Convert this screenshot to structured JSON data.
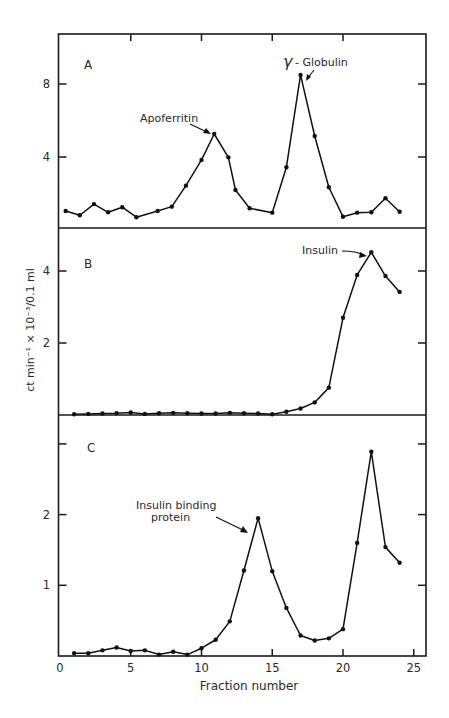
{
  "figure": {
    "xlabel": "Fraction number",
    "ylabel": "ct min⁻¹ × 10⁻³/0.1 ml",
    "x_ticks": [
      0,
      5,
      10,
      15,
      20,
      25
    ]
  },
  "chart_data": [
    {
      "type": "line",
      "panel": "A",
      "title": "A",
      "xlabel": "Fraction number",
      "ylabel": "ct min⁻¹ × 10⁻³/0.1 ml",
      "ylim": [
        0,
        10.6
      ],
      "y_ticks": [
        4,
        8
      ],
      "xlim": [
        0,
        26
      ],
      "grid": false,
      "x": [
        0.4,
        1.4,
        2.4,
        3.4,
        4.4,
        5.4,
        6.9,
        7.9,
        8.9,
        10,
        10.9,
        11.9,
        12.4,
        13.4,
        15,
        16,
        17,
        18,
        19,
        20,
        21,
        22,
        23,
        24
      ],
      "values": [
        1.04,
        0.81,
        1.42,
        0.97,
        1.25,
        0.7,
        1.04,
        1.28,
        2.43,
        3.84,
        5.26,
        3.98,
        2.19,
        1.19,
        0.95,
        3.44,
        8.5,
        5.15,
        2.34,
        0.73,
        0.95,
        0.97,
        1.74,
        1.0
      ],
      "annotations": [
        {
          "text": "Apoferritin",
          "x": 10.9,
          "y": 5.26
        },
        {
          "text": "γ - Globulin",
          "x": 17,
          "y": 8.5
        }
      ]
    },
    {
      "type": "line",
      "panel": "B",
      "title": "B",
      "xlabel": "Fraction number",
      "ylabel": "ct min⁻¹ × 10⁻³/0.1 ml",
      "ylim": [
        0,
        5.2
      ],
      "y_ticks": [
        2,
        4
      ],
      "xlim": [
        0,
        26
      ],
      "grid": false,
      "x": [
        1,
        2,
        3,
        4,
        5,
        6,
        7,
        8,
        9,
        10,
        11,
        12,
        13,
        14,
        15,
        16,
        17,
        18,
        19,
        20,
        21,
        22,
        23,
        24
      ],
      "values": [
        0.02,
        0.03,
        0.04,
        0.05,
        0.07,
        0.03,
        0.05,
        0.06,
        0.05,
        0.04,
        0.04,
        0.06,
        0.05,
        0.04,
        0.02,
        0.09,
        0.18,
        0.35,
        0.76,
        2.7,
        3.89,
        4.52,
        3.86,
        3.42
      ],
      "annotations": [
        {
          "text": "Insulin",
          "x": 22,
          "y": 4.52
        }
      ]
    },
    {
      "type": "line",
      "panel": "C",
      "title": "C",
      "xlabel": "Fraction number",
      "ylabel": "ct min⁻¹ × 10⁻³/0.1 ml",
      "ylim": [
        0,
        3.4
      ],
      "y_ticks": [
        1,
        2,
        3
      ],
      "y_tick_labels": [
        "1",
        "2",
        ""
      ],
      "xlim": [
        0,
        26
      ],
      "grid": false,
      "x": [
        1,
        2,
        3,
        4,
        5,
        6,
        7,
        8,
        9,
        10,
        11,
        12,
        13,
        14,
        15,
        16,
        17,
        18,
        19,
        20,
        21,
        22,
        23,
        24
      ],
      "values": [
        0.04,
        0.04,
        0.08,
        0.12,
        0.07,
        0.08,
        0.02,
        0.06,
        0.02,
        0.11,
        0.23,
        0.49,
        1.21,
        1.95,
        1.2,
        0.68,
        0.29,
        0.22,
        0.25,
        0.38,
        1.6,
        2.89,
        1.54,
        1.32
      ],
      "annotations": [
        {
          "text": "Insulin binding protein",
          "x": 14,
          "y": 1.95
        }
      ]
    }
  ],
  "labels": {
    "panel_a": "A",
    "panel_b": "B",
    "panel_c": "C",
    "apoferritin": "Apoferritin",
    "globulin": "- Globulin",
    "gamma": "γ",
    "insulin": "Insulin",
    "ibp_line1": "Insulin binding",
    "ibp_line2": "protein"
  }
}
